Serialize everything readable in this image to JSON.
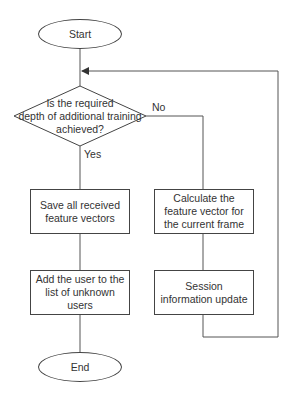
{
  "diagram": {
    "type": "flowchart",
    "nodes": {
      "start": "Start",
      "decision": "Is the required depth of additional training achieved?",
      "decision_lines": [
        "Is the required",
        "depth of additional training",
        "achieved?"
      ],
      "save": "Save all received feature vectors",
      "add_user": "Add the user to the list of unknown users",
      "calculate": "Calculate the feature vector for the current frame",
      "session": "Session information update",
      "end": "End"
    },
    "edge_labels": {
      "yes": "Yes",
      "no": "No"
    },
    "edges": [
      {
        "from": "start",
        "to": "decision"
      },
      {
        "from": "decision",
        "to": "save",
        "label": "Yes"
      },
      {
        "from": "save",
        "to": "add_user"
      },
      {
        "from": "add_user",
        "to": "end"
      },
      {
        "from": "decision",
        "to": "calculate",
        "label": "No"
      },
      {
        "from": "calculate",
        "to": "session"
      },
      {
        "from": "session",
        "to": "decision",
        "note": "loop back"
      }
    ],
    "colors": {
      "stroke": "#444444",
      "text": "#333333",
      "background": "#ffffff"
    }
  }
}
